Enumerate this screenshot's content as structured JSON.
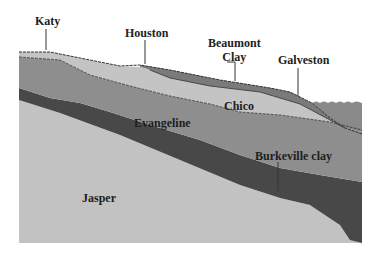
{
  "diagram": {
    "locations": [
      {
        "id": "katy",
        "label": "Katy"
      },
      {
        "id": "houston",
        "label": "Houston"
      },
      {
        "id": "beaumont",
        "label_line1": "Beaumont",
        "label_line2": "Clay"
      },
      {
        "id": "galveston",
        "label": "Galveston"
      }
    ],
    "layers": [
      {
        "id": "beaumont-clay",
        "label": "Beaumont Clay",
        "color": "#7b7b7b"
      },
      {
        "id": "chico",
        "label": "Chico",
        "color": "#c4c4c4"
      },
      {
        "id": "evangeline",
        "label": "Evangeline",
        "color": "#8e8e8e"
      },
      {
        "id": "burkeville",
        "label": "Burkeville clay",
        "color": "#4a4a4a"
      },
      {
        "id": "jasper",
        "label": "Jasper",
        "color": "#c2c2c2"
      },
      {
        "id": "gulf-water",
        "label": "",
        "color": "#8a8a8a"
      }
    ]
  }
}
